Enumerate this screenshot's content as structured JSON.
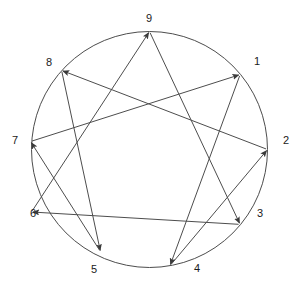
{
  "figure": {
    "background_color": "#ffffff",
    "line_color": "#4d4d4d",
    "circle_color": "#4d4d4d",
    "label_color": "#1a1a1a",
    "circle": {
      "cx": 149.5,
      "cy": 149.5,
      "r": 118,
      "stroke_width": 1
    }
  },
  "nodes": [
    {
      "id": "1",
      "label": "1",
      "angle_deg": 40,
      "cx": 240.1,
      "cy": 74.6,
      "label_x": 257,
      "label_y": 62
    },
    {
      "id": "2",
      "label": "2",
      "angle_deg": 0,
      "cx": 267.5,
      "cy": 149.5,
      "label_x": 286,
      "label_y": 141
    },
    {
      "id": "3",
      "label": "3",
      "angle_deg": -40,
      "cx": 240.1,
      "cy": 224.4,
      "label_x": 260,
      "label_y": 214
    },
    {
      "id": "4",
      "label": "4",
      "angle_deg": -80,
      "cx": 170.0,
      "cy": 265.7,
      "label_x": 197,
      "label_y": 269
    },
    {
      "id": "5",
      "label": "5",
      "angle_deg": -120,
      "cx": 100.5,
      "cy": 251.7,
      "label_x": 94,
      "label_y": 270
    },
    {
      "id": "6",
      "label": "6",
      "angle_deg": 180,
      "cx": 31.5,
      "cy": 212.0,
      "label_x": 33,
      "label_y": 214
    },
    {
      "id": "7",
      "label": "7",
      "angle_deg": 160,
      "cx": 30.6,
      "cy": 141.5,
      "label_x": 15,
      "label_y": 141
    },
    {
      "id": "8",
      "label": "8",
      "angle_deg": 130,
      "cx": 61.6,
      "cy": 70.4,
      "label_x": 49,
      "label_y": 63
    },
    {
      "id": "9",
      "label": "9",
      "angle_deg": 90,
      "cx": 149.5,
      "cy": 31.5,
      "label_x": 149,
      "label_y": 19
    }
  ],
  "connections": {
    "triangle": {
      "name": "inner-triangle",
      "sequence": [
        "9",
        "6",
        "3",
        "9"
      ],
      "edges": [
        {
          "from": "6",
          "to": "9",
          "arrow": "to"
        },
        {
          "from": "3",
          "to": "6",
          "arrow": "to"
        },
        {
          "from": "9",
          "to": "3",
          "arrow": "to"
        }
      ]
    },
    "hexad": {
      "name": "hexad-path",
      "sequence": [
        "1",
        "4",
        "2",
        "8",
        "5",
        "7",
        "1"
      ],
      "edges": [
        {
          "from": "1",
          "to": "4",
          "arrow": "to"
        },
        {
          "from": "4",
          "to": "2",
          "arrow": "to"
        },
        {
          "from": "2",
          "to": "8",
          "arrow": "to"
        },
        {
          "from": "8",
          "to": "5",
          "arrow": "to"
        },
        {
          "from": "5",
          "to": "7",
          "arrow": "to"
        },
        {
          "from": "7",
          "to": "1",
          "arrow": "to"
        }
      ]
    }
  },
  "chart_data": {
    "type": "diagram",
    "categories": [
      "1",
      "2",
      "3",
      "4",
      "5",
      "6",
      "7",
      "8",
      "9"
    ],
    "node_count": 9,
    "edge_count": 9,
    "directed": true,
    "edges": [
      [
        "1",
        "4"
      ],
      [
        "4",
        "2"
      ],
      [
        "2",
        "8"
      ],
      [
        "8",
        "5"
      ],
      [
        "5",
        "7"
      ],
      [
        "7",
        "1"
      ],
      [
        "9",
        "3"
      ],
      [
        "3",
        "6"
      ],
      [
        "6",
        "9"
      ]
    ]
  }
}
